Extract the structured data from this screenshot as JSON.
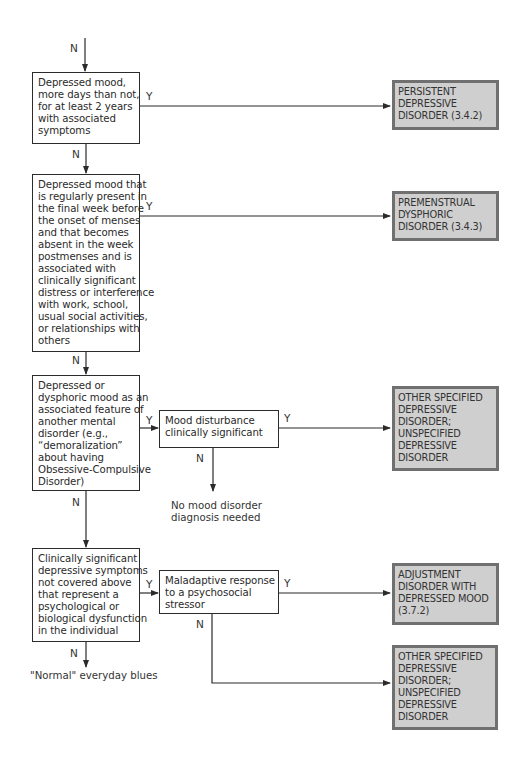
{
  "diagram": {
    "type": "decision-flowchart",
    "colors": {
      "decision_border": "#2b2b2b",
      "result_fill": "#cfcfcf",
      "result_border": "#707070",
      "line": "#2b2b2b"
    },
    "entry_label": "N",
    "decisions": [
      {
        "id": "d1",
        "lines": [
          "Depressed mood,",
          "more days than not,",
          "for at least 2 years",
          "with associated",
          "symptoms"
        ],
        "yes_label": "Y",
        "no_label": "N"
      },
      {
        "id": "d2",
        "lines": [
          "Depressed mood that",
          "is regularly present in",
          "the final week before",
          "the onset of menses",
          "and that becomes",
          "absent in the week",
          "postmenses and is",
          "associated with",
          "clinically significant",
          "distress or interference",
          "with work, school,",
          "usual social activities,",
          "or relationships with",
          "others"
        ],
        "yes_label": "Y",
        "no_label": "N"
      },
      {
        "id": "d3",
        "lines": [
          "Depressed or",
          "dysphoric mood as an",
          "associated feature of",
          "another mental",
          "disorder (e.g.,",
          "“demoralization”",
          "about having",
          "Obsessive-Compulsive",
          "Disorder)"
        ],
        "yes_label": "Y",
        "no_label": "N"
      },
      {
        "id": "d3b",
        "lines": [
          "Mood disturbance",
          "clinically significant"
        ],
        "yes_label": "Y",
        "no_label": "N"
      },
      {
        "id": "d4",
        "lines": [
          "Clinically significant",
          "depressive symptoms",
          "not covered above",
          "that represent a",
          "psychological or",
          "biological dysfunction",
          "in the individual"
        ],
        "yes_label": "Y",
        "no_label": "N"
      },
      {
        "id": "d4b",
        "lines": [
          "Maladaptive response",
          "to a psychosocial",
          "stressor"
        ],
        "yes_label": "Y",
        "no_label": "N"
      }
    ],
    "results": [
      {
        "id": "r1",
        "lines": [
          "PERSISTENT",
          "DEPRESSIVE",
          "DISORDER (3.4.2)"
        ]
      },
      {
        "id": "r2",
        "lines": [
          "PREMENSTRUAL",
          "DYSPHORIC",
          "DISORDER (3.4.3)"
        ]
      },
      {
        "id": "r3",
        "lines": [
          "OTHER SPECIFIED",
          "DEPRESSIVE",
          "DISORDER;",
          "UNSPECIFIED",
          "DEPRESSIVE",
          "DISORDER"
        ]
      },
      {
        "id": "r4",
        "lines": [
          "ADJUSTMENT",
          "DISORDER WITH",
          "DEPRESSED MOOD",
          "(3.7.2)"
        ]
      },
      {
        "id": "r5",
        "lines": [
          "OTHER SPECIFIED",
          "DEPRESSIVE",
          "DISORDER;",
          "UNSPECIFIED",
          "DEPRESSIVE",
          "DISORDER"
        ]
      }
    ],
    "terminal_notes": {
      "no_mood": [
        "No mood disorder",
        "diagnosis needed"
      ],
      "normal_blues": "\"Normal\" everyday blues"
    }
  }
}
